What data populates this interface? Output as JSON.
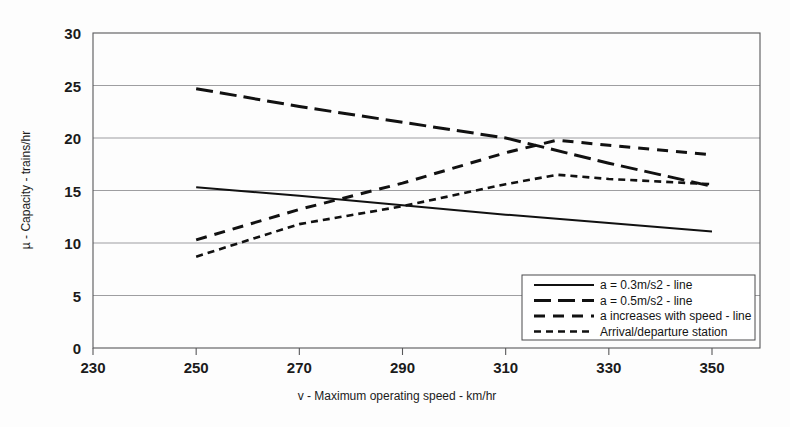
{
  "chart_data": {
    "type": "line",
    "title": "",
    "xlabel": "v - Maximum operating speed - km/hr",
    "ylabel": "µ - Capacity - trains/hr",
    "xlim": [
      230,
      350
    ],
    "ylim": [
      0,
      30
    ],
    "xticks": [
      230,
      250,
      270,
      290,
      310,
      330,
      350
    ],
    "yticks": [
      0,
      5,
      10,
      15,
      20,
      25,
      30
    ],
    "grid": true,
    "legend_position": "lower-right",
    "series": [
      {
        "name": "a = 0.3m/s2 - line",
        "style": "solid",
        "x": [
          250,
          270,
          290,
          310,
          330,
          350
        ],
        "values": [
          15.3,
          14.5,
          13.6,
          12.7,
          11.9,
          11.1
        ]
      },
      {
        "name": "a = 0.5m/s2 - line",
        "style": "long-dash",
        "x": [
          250,
          270,
          290,
          310,
          330,
          350
        ],
        "values": [
          24.7,
          23.0,
          21.5,
          20.0,
          17.6,
          15.4
        ]
      },
      {
        "name": "a  increases with speed - line",
        "style": "medium-dash",
        "x": [
          250,
          270,
          290,
          310,
          320,
          330,
          350
        ],
        "values": [
          10.3,
          13.2,
          15.7,
          18.6,
          19.8,
          19.3,
          18.4
        ]
      },
      {
        "name": "Arrival/departure  station",
        "style": "short-dash",
        "x": [
          250,
          270,
          290,
          310,
          320,
          330,
          350
        ],
        "values": [
          8.7,
          11.8,
          13.5,
          15.6,
          16.5,
          16.1,
          15.6
        ]
      }
    ]
  },
  "axis": {
    "y_label": "µ - Capacity - trains/hr",
    "x_label": "v - Maximum operating speed - km/hr",
    "x_tick_labels": [
      "230",
      "250",
      "270",
      "290",
      "310",
      "330",
      "350"
    ],
    "y_tick_labels": [
      "0",
      "5",
      "10",
      "15",
      "20",
      "25",
      "30"
    ]
  },
  "legend": {
    "entries": [
      {
        "label": "a = 0.3m/s2 - line",
        "style": "solid"
      },
      {
        "label": "a = 0.5m/s2 - line",
        "style": "long-dash"
      },
      {
        "label": "a  increases with speed - line",
        "style": "medium-dash"
      },
      {
        "label": "Arrival/departure  station",
        "style": "short-dash"
      }
    ]
  },
  "colors": {
    "line": "#111111",
    "grid": "#8d8d90",
    "frame": "#58585a",
    "background": "#fdfdfd",
    "text": "#1b1b1b"
  }
}
